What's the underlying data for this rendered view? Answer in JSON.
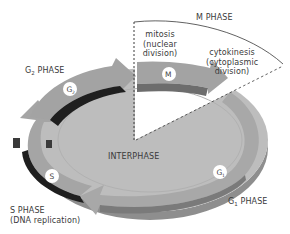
{
  "diagram": {
    "colors": {
      "background": "#ffffff",
      "disc_top": "#bdbdbd",
      "disc_side": "#8e8e8e",
      "arrow_top": "#a3a3a3",
      "arrow_side_dark": "#1f1f1f",
      "arrow_side_mid": "#6d6d6d",
      "text": "#3a3a3a",
      "badge_fill": "#ffffff"
    },
    "labels": {
      "m_phase": "M PHASE",
      "mitosis": [
        "mitosis",
        "(nuclear",
        "division)"
      ],
      "cytokinesis": [
        "cytokinesis",
        "(cytoplasmic",
        "division)"
      ],
      "g2_phase": {
        "letter": "G",
        "sub": "2",
        "suffix": " PHASE"
      },
      "interphase": "INTERPHASE",
      "s_phase": [
        "S PHASE",
        "(DNA replication)"
      ],
      "g1_phase": {
        "letter": "G",
        "sub": "1",
        "suffix": " PHASE"
      }
    },
    "badges": [
      {
        "id": "g2",
        "letter": "G",
        "sub": "2"
      },
      {
        "id": "m",
        "letter": "M",
        "sub": ""
      },
      {
        "id": "s",
        "letter": "S",
        "sub": ""
      },
      {
        "id": "g1",
        "letter": "G",
        "sub": "1"
      }
    ],
    "nodes": [
      "G1 PHASE",
      "S PHASE",
      "G2 PHASE",
      "M PHASE",
      "INTERPHASE"
    ],
    "edges": [
      {
        "from": "G1",
        "to": "S"
      },
      {
        "from": "S",
        "to": "G2"
      },
      {
        "from": "G2",
        "to": "M"
      },
      {
        "from": "M",
        "to": "G1"
      }
    ]
  }
}
